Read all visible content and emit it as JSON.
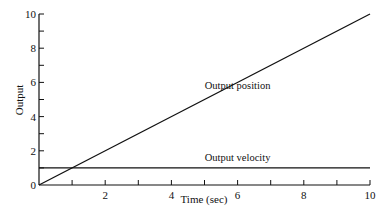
{
  "chart_data": {
    "type": "line",
    "title": "",
    "xlabel": "Time (sec)",
    "ylabel": "Output",
    "xlim": [
      0,
      10
    ],
    "ylim": [
      0,
      10
    ],
    "x_ticks": [
      0,
      2,
      4,
      6,
      8,
      10
    ],
    "y_ticks": [
      0,
      2,
      4,
      6,
      8,
      10
    ],
    "x_tick_labels": [
      "2",
      "4",
      "6",
      "8",
      "10"
    ],
    "y_tick_labels": [
      "0",
      "2",
      "4",
      "6",
      "8",
      "10"
    ],
    "grid": false,
    "legend": "none (inline annotations)",
    "series": [
      {
        "name": "Output position",
        "x": [
          0,
          10
        ],
        "y": [
          0,
          10
        ]
      },
      {
        "name": "Output velocity",
        "x": [
          0,
          10
        ],
        "y": [
          1,
          1
        ]
      }
    ],
    "annotations": [
      {
        "text": "Output position",
        "x": 6,
        "y": 5.6
      },
      {
        "text": "Output velocity",
        "x": 6,
        "y": 1.4
      }
    ]
  }
}
